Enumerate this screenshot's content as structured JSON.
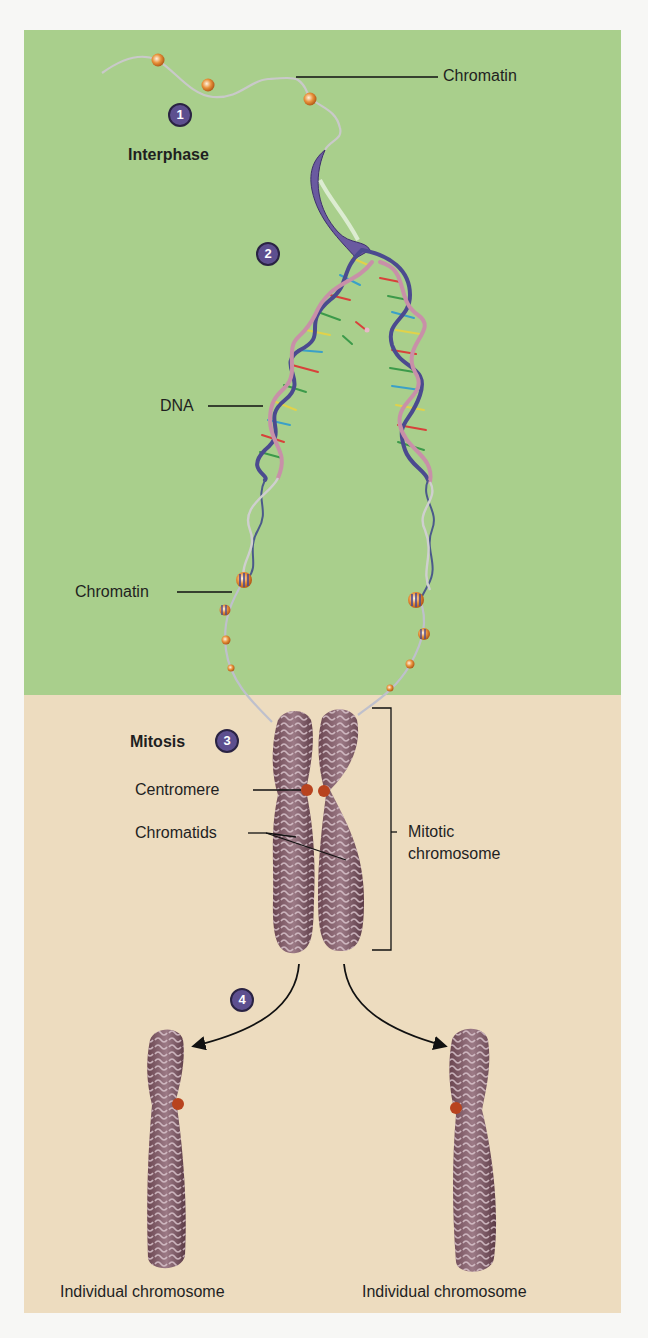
{
  "figure": {
    "colors": {
      "interphase_bg": "#a9cf8c",
      "mitosis_bg": "#eddcbf",
      "step_badge": "#5d4f8f",
      "chromosome": "#7a5560",
      "centromere": "#b8431e"
    },
    "stages": {
      "interphase": "Interphase",
      "mitosis": "Mitosis"
    },
    "steps": [
      {
        "number": "1"
      },
      {
        "number": "2"
      },
      {
        "number": "3"
      },
      {
        "number": "4"
      }
    ],
    "labels": {
      "chromatin_top": "Chromatin",
      "dna": "DNA",
      "chromatin_mid": "Chromatin",
      "centromere": "Centromere",
      "chromatids": "Chromatids",
      "mitotic_line1": "Mitotic",
      "mitotic_line2": "chromosome",
      "individual_left": "Individual chromosome",
      "individual_right": "Individual chromosome"
    }
  }
}
